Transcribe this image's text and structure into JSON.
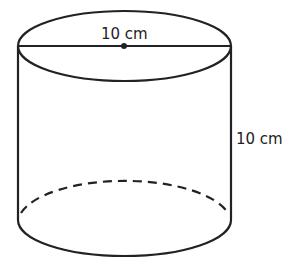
{
  "diagram": {
    "shape": "cylinder",
    "diameter_label": "10 cm",
    "height_label": "10 cm",
    "stroke_color": "#222222",
    "background": "#ffffff"
  }
}
